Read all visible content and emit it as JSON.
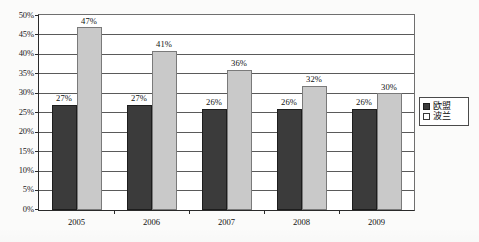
{
  "chart_data": {
    "type": "bar",
    "title": "",
    "subtitle": "",
    "xlabel": "",
    "ylabel": "",
    "categories": [
      "2005",
      "2006",
      "2007",
      "2008",
      "2009"
    ],
    "series": [
      {
        "name": "欧盟",
        "values": [
          27,
          27,
          26,
          26,
          26
        ],
        "value_labels": [
          "27%",
          "27%",
          "26%",
          "26%",
          "26%"
        ],
        "color": "#3b3b3b"
      },
      {
        "name": "波兰",
        "values": [
          47,
          41,
          36,
          32,
          30
        ],
        "value_labels": [
          "47%",
          "41%",
          "36%",
          "32%",
          "30%"
        ],
        "color": "#c9c9c9"
      }
    ],
    "ylim": [
      0,
      50
    ],
    "ytick_step": 5,
    "ytick_labels": [
      "50%",
      "45%",
      "40%",
      "35%",
      "30%",
      "25%",
      "20%",
      "15%",
      "10%",
      "5%",
      "0%"
    ],
    "ytick_values": [
      50,
      45,
      40,
      35,
      30,
      25,
      20,
      15,
      10,
      5,
      0
    ],
    "grid": true,
    "grid_axis": "y",
    "legend_position": "right",
    "legend_entries": [
      {
        "label": "欧盟",
        "swatch": "filled-dark-square"
      },
      {
        "label": "波兰",
        "swatch": "outlined-light-square"
      }
    ],
    "value_label_suffix": "%"
  }
}
